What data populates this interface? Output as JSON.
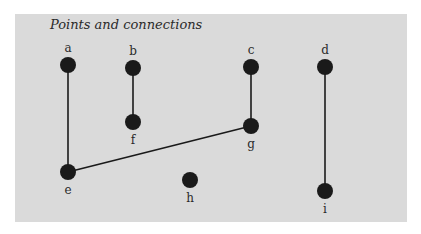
{
  "title": "Points and connections",
  "colors": {
    "background": "#dadada",
    "node": "#1a1a1a",
    "edge": "#1a1a1a",
    "text": "#2a2a2a"
  },
  "nodes": [
    {
      "id": "a",
      "label": "a",
      "x": 68,
      "y": 65,
      "label_pos": "above"
    },
    {
      "id": "b",
      "label": "b",
      "x": 133,
      "y": 68,
      "label_pos": "above"
    },
    {
      "id": "c",
      "label": "c",
      "x": 251,
      "y": 67,
      "label_pos": "above"
    },
    {
      "id": "d",
      "label": "d",
      "x": 325,
      "y": 67,
      "label_pos": "above"
    },
    {
      "id": "e",
      "label": "e",
      "x": 68,
      "y": 172,
      "label_pos": "below"
    },
    {
      "id": "f",
      "label": "f",
      "x": 133,
      "y": 122,
      "label_pos": "below"
    },
    {
      "id": "g",
      "label": "g",
      "x": 251,
      "y": 126,
      "label_pos": "below"
    },
    {
      "id": "h",
      "label": "h",
      "x": 190,
      "y": 180,
      "label_pos": "below"
    },
    {
      "id": "i",
      "label": "i",
      "x": 325,
      "y": 191,
      "label_pos": "below"
    }
  ],
  "edges": [
    {
      "from": "a",
      "to": "e"
    },
    {
      "from": "b",
      "to": "f"
    },
    {
      "from": "c",
      "to": "g"
    },
    {
      "from": "d",
      "to": "i"
    },
    {
      "from": "e",
      "to": "g"
    }
  ]
}
